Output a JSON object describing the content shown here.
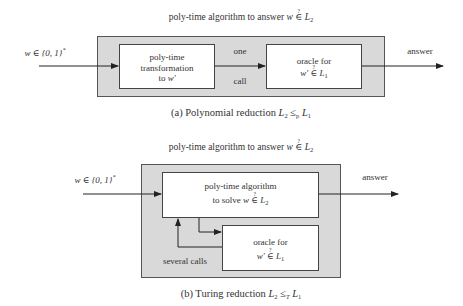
{
  "diagram_a": {
    "title_prefix": "poly-time algorithm to answer",
    "title_math": "w ∈? L2",
    "input_label": "w ∈ {0,1}*",
    "box_left": {
      "line1": "poly-time",
      "line2": "transformation",
      "line3": "to w′"
    },
    "mid_label_top": "one",
    "mid_label_bottom": "call",
    "box_right": {
      "line1": "oracle for",
      "line2": "w′ ∈? L1"
    },
    "output_label": "answer",
    "caption_prefix": "(a) Polynomial reduction",
    "caption_math": "L2 ≤p L1"
  },
  "diagram_b": {
    "title_prefix": "poly-time algorithm to answer",
    "title_math": "w ∈? L2",
    "input_label": "w ∈ {0,1}*",
    "box_top": {
      "line1": "poly-time algorithm",
      "line2_prefix": "to solve",
      "line2_math": "w ∈? L2"
    },
    "box_oracle": {
      "line1": "oracle for",
      "line2": "w′ ∈? L1"
    },
    "loop_label": "several calls",
    "output_label": "answer",
    "caption_prefix": "(b) Turing reduction",
    "caption_math": "L2 ≤T L1"
  },
  "colors": {
    "outer_fill": "#d9d9d9",
    "inner_fill": "#ffffff",
    "stroke": "#333333"
  }
}
